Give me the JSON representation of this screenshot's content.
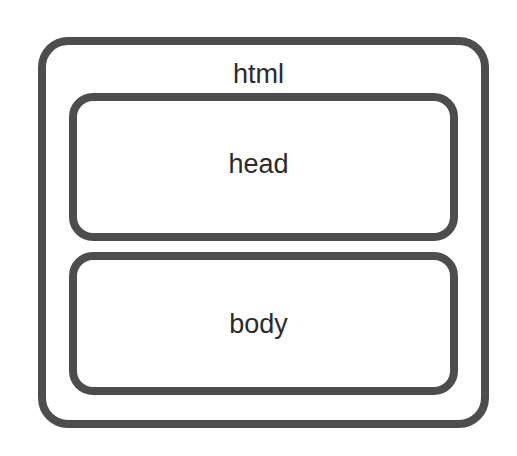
{
  "diagram": {
    "type": "nested-boxes",
    "stroke_color": "#4d4d4d",
    "text_color": "#2b2b2b",
    "outer": {
      "label": "html"
    },
    "children": [
      {
        "label": "head"
      },
      {
        "label": "body"
      }
    ]
  }
}
